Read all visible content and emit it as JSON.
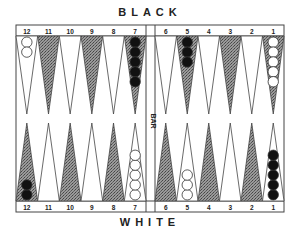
{
  "title_top": "BLACK",
  "title_bottom": "WHITE",
  "bar_label": "BAR",
  "colors": {
    "line": "#444444",
    "shade": "#8a8a8a",
    "black_checker": "#111111",
    "white_checker": "#ffffff"
  },
  "top_points": [
    {
      "num": "12",
      "shaded": false,
      "checkers": 2,
      "color": "white"
    },
    {
      "num": "11",
      "shaded": true,
      "checkers": 0,
      "color": ""
    },
    {
      "num": "10",
      "shaded": false,
      "checkers": 0,
      "color": ""
    },
    {
      "num": "9",
      "shaded": true,
      "checkers": 0,
      "color": ""
    },
    {
      "num": "8",
      "shaded": false,
      "checkers": 0,
      "color": ""
    },
    {
      "num": "7",
      "shaded": true,
      "checkers": 5,
      "color": "black"
    },
    {
      "num": "6",
      "shaded": false,
      "checkers": 0,
      "color": ""
    },
    {
      "num": "5",
      "shaded": true,
      "checkers": 3,
      "color": "black"
    },
    {
      "num": "4",
      "shaded": false,
      "checkers": 0,
      "color": ""
    },
    {
      "num": "3",
      "shaded": true,
      "checkers": 0,
      "color": ""
    },
    {
      "num": "2",
      "shaded": false,
      "checkers": 0,
      "color": ""
    },
    {
      "num": "1",
      "shaded": true,
      "checkers": 5,
      "color": "white"
    }
  ],
  "bottom_points": [
    {
      "num": "12",
      "shaded": true,
      "checkers": 2,
      "color": "black"
    },
    {
      "num": "11",
      "shaded": false,
      "checkers": 0,
      "color": ""
    },
    {
      "num": "10",
      "shaded": true,
      "checkers": 0,
      "color": ""
    },
    {
      "num": "9",
      "shaded": false,
      "checkers": 0,
      "color": ""
    },
    {
      "num": "8",
      "shaded": true,
      "checkers": 0,
      "color": ""
    },
    {
      "num": "7",
      "shaded": false,
      "checkers": 5,
      "color": "white"
    },
    {
      "num": "6",
      "shaded": true,
      "checkers": 0,
      "color": ""
    },
    {
      "num": "5",
      "shaded": false,
      "checkers": 3,
      "color": "white"
    },
    {
      "num": "4",
      "shaded": true,
      "checkers": 0,
      "color": ""
    },
    {
      "num": "3",
      "shaded": false,
      "checkers": 0,
      "color": ""
    },
    {
      "num": "2",
      "shaded": true,
      "checkers": 0,
      "color": ""
    },
    {
      "num": "1",
      "shaded": false,
      "checkers": 5,
      "color": "black"
    }
  ]
}
